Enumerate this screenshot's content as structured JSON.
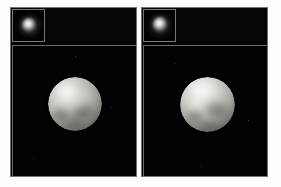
{
  "figure": {
    "background_color": "#ffffff",
    "panel_background_color": "#050505",
    "frame_border_color": "#6f6f6f",
    "panel_count": 2
  },
  "panels": [
    {
      "id": "panel-left",
      "name": "left-observation-panel",
      "background_color": "#050505",
      "border_color": "#6f6f6f",
      "inset": {
        "name": "left-raw-image-inset",
        "type": "low-resolution-point-source",
        "border_color": "#777777",
        "background_color": "#030303",
        "blob": {
          "name": "fuzzy-bright-blob",
          "center_x_pct": 48,
          "center_y_pct": 45,
          "peak_color": "#ffffff",
          "halo_color": "#9d9d9d"
        }
      },
      "main": {
        "name": "left-reconstructed-globe-view",
        "border_color": "#6a6a6a",
        "background_color": "#020202",
        "globe": {
          "name": "reconstructed-sphere",
          "center_x_pct": 49,
          "center_y_pct": 45,
          "diameter_px": 54,
          "highlight_position": "upper-left",
          "bright_color": "#f0f0ee",
          "mid_color": "#b9b9b4",
          "dark_color": "#6a6a63",
          "features": [
            {
              "name": "bright-polar-frost-region",
              "position": "north-west",
              "tone": "bright"
            },
            {
              "name": "dark-equatorial-patch",
              "position": "center-east",
              "tone": "dark"
            },
            {
              "name": "dark-southwest-patch",
              "position": "south-west",
              "tone": "dark"
            },
            {
              "name": "mid-bright-northeast-area",
              "position": "north-east",
              "tone": "medium-bright"
            },
            {
              "name": "dark-southern-limb-band",
              "position": "south",
              "tone": "dark"
            }
          ]
        }
      }
    },
    {
      "id": "panel-right",
      "name": "right-observation-panel",
      "background_color": "#050505",
      "border_color": "#6f6f6f",
      "inset": {
        "name": "right-raw-image-inset",
        "type": "low-resolution-point-source",
        "border_color": "#777777",
        "background_color": "#030303",
        "blob": {
          "name": "fuzzy-bright-blob",
          "center_x_pct": 50,
          "center_y_pct": 43,
          "peak_color": "#ffffff",
          "halo_color": "#9d9d9d"
        }
      },
      "main": {
        "name": "right-reconstructed-globe-view",
        "border_color": "#6a6a6a",
        "background_color": "#020202",
        "globe": {
          "name": "reconstructed-sphere",
          "center_x_pct": 51,
          "center_y_pct": 45,
          "diameter_px": 55,
          "highlight_position": "upper-left",
          "bright_color": "#f4f4f2",
          "mid_color": "#c0c0bb",
          "dark_color": "#6d6d66",
          "features": [
            {
              "name": "bright-north-polar-cap",
              "position": "north",
              "tone": "bright"
            },
            {
              "name": "dark-equatorial-band",
              "position": "center-east",
              "tone": "dark"
            },
            {
              "name": "dark-southwest-patch",
              "position": "south-west",
              "tone": "dark"
            },
            {
              "name": "bright-western-highlight",
              "position": "west",
              "tone": "bright"
            },
            {
              "name": "dark-southern-limb-band",
              "position": "south",
              "tone": "dark"
            }
          ]
        }
      }
    }
  ],
  "labels": {
    "visible_text": []
  }
}
